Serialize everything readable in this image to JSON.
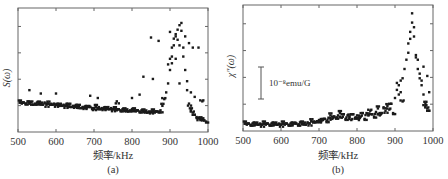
{
  "chart_data": [
    {
      "panel": "a",
      "type": "scatter",
      "title": "",
      "caption": "(a)",
      "xlabel": "频率/kHz",
      "ylabel": "S(ω)",
      "xlim": [
        500,
        1000
      ],
      "xticks": [
        500,
        600,
        700,
        800,
        900,
        1000
      ],
      "ylim": [
        0,
        1
      ],
      "yticks_count": 4,
      "yticks_labeled": false,
      "grid": false,
      "legend": null,
      "annotations": [],
      "series": [
        {
          "name": "S(ω)",
          "x": [
            505,
            510,
            515,
            520,
            525,
            530,
            535,
            540,
            545,
            550,
            555,
            560,
            565,
            570,
            575,
            580,
            585,
            590,
            595,
            600,
            605,
            610,
            615,
            620,
            625,
            630,
            635,
            640,
            645,
            650,
            655,
            660,
            665,
            670,
            675,
            680,
            685,
            690,
            695,
            700,
            705,
            710,
            715,
            720,
            725,
            730,
            735,
            740,
            745,
            750,
            755,
            760,
            765,
            770,
            775,
            780,
            785,
            790,
            795,
            800,
            805,
            810,
            815,
            820,
            825,
            830,
            835,
            840,
            845,
            850,
            855,
            860,
            865,
            870,
            875,
            880,
            885,
            890,
            895,
            900,
            905,
            910,
            915,
            920,
            925,
            930,
            935,
            940,
            945,
            950,
            955,
            960,
            965,
            970,
            975,
            980,
            985,
            990,
            995,
            530,
            560,
            600,
            690,
            710,
            760,
            800,
            820,
            830,
            850,
            855,
            870,
            895,
            900,
            905,
            910,
            915,
            920,
            925,
            930,
            935,
            940,
            950,
            960,
            975,
            900,
            905,
            915,
            925,
            945,
            955,
            965,
            985
          ],
          "y": [
            0.21,
            0.2,
            0.21,
            0.2,
            0.22,
            0.2,
            0.21,
            0.19,
            0.2,
            0.21,
            0.2,
            0.2,
            0.19,
            0.21,
            0.19,
            0.2,
            0.19,
            0.19,
            0.2,
            0.19,
            0.18,
            0.19,
            0.18,
            0.19,
            0.18,
            0.18,
            0.19,
            0.17,
            0.18,
            0.18,
            0.17,
            0.18,
            0.16,
            0.17,
            0.17,
            0.16,
            0.17,
            0.17,
            0.16,
            0.16,
            0.17,
            0.16,
            0.15,
            0.16,
            0.16,
            0.15,
            0.16,
            0.15,
            0.16,
            0.15,
            0.15,
            0.14,
            0.15,
            0.14,
            0.15,
            0.14,
            0.14,
            0.13,
            0.14,
            0.15,
            0.14,
            0.13,
            0.14,
            0.13,
            0.14,
            0.13,
            0.13,
            0.12,
            0.13,
            0.13,
            0.13,
            0.12,
            0.13,
            0.13,
            0.14,
            0.18,
            0.24,
            0.3,
            0.38,
            0.5,
            0.62,
            0.72,
            0.8,
            0.86,
            0.9,
            0.85,
            0.7,
            0.5,
            0.32,
            0.2,
            0.14,
            0.12,
            0.1,
            0.08,
            0.07,
            0.06,
            0.06,
            0.05,
            0.04,
            0.32,
            0.29,
            0.29,
            0.27,
            0.25,
            0.22,
            0.25,
            0.28,
            0.44,
            0.79,
            0.42,
            0.76,
            0.55,
            0.84,
            0.7,
            0.78,
            0.82,
            0.77,
            0.72,
            0.92,
            0.62,
            0.8,
            0.74,
            0.7,
            0.7,
            0.6,
            0.56,
            0.6,
            0.38,
            0.4,
            0.3,
            0.26,
            0.22
          ]
        }
      ]
    },
    {
      "panel": "b",
      "type": "scatter",
      "title": "",
      "caption": "(b)",
      "xlabel": "频率/kHz",
      "ylabel": "χ″(ω)",
      "xlim": [
        500,
        1000
      ],
      "xticks": [
        500,
        600,
        700,
        800,
        900,
        1000
      ],
      "ylim": [
        0,
        1
      ],
      "yticks_count": 4,
      "yticks_labeled": false,
      "grid": false,
      "legend": null,
      "annotations": [
        {
          "type": "scale-bar",
          "text": "10⁻⁸emu/G",
          "length_fraction": 0.26
        }
      ],
      "series": [
        {
          "name": "χ″(ω)",
          "x": [
            505,
            510,
            515,
            520,
            525,
            530,
            535,
            540,
            545,
            550,
            555,
            560,
            565,
            570,
            575,
            580,
            585,
            590,
            595,
            600,
            605,
            610,
            615,
            620,
            625,
            630,
            635,
            640,
            645,
            650,
            655,
            660,
            665,
            670,
            675,
            680,
            685,
            690,
            695,
            700,
            705,
            710,
            715,
            720,
            725,
            730,
            735,
            740,
            745,
            750,
            755,
            760,
            765,
            770,
            775,
            780,
            785,
            790,
            795,
            800,
            805,
            810,
            815,
            820,
            825,
            830,
            835,
            840,
            845,
            850,
            855,
            860,
            865,
            870,
            875,
            880,
            885,
            890,
            895,
            900,
            905,
            910,
            915,
            920,
            925,
            930,
            935,
            940,
            945,
            950,
            955,
            960,
            965,
            970,
            975,
            980,
            985,
            990,
            905,
            910,
            915,
            920,
            935,
            940,
            945,
            950,
            955,
            960,
            965,
            970,
            975,
            980,
            985,
            990
          ],
          "y": [
            0.03,
            0.02,
            0.03,
            0.02,
            0.03,
            0.02,
            0.03,
            0.02,
            0.03,
            0.02,
            0.03,
            0.02,
            0.03,
            0.02,
            0.03,
            0.02,
            0.03,
            0.02,
            0.03,
            0.02,
            0.03,
            0.02,
            0.03,
            0.02,
            0.03,
            0.02,
            0.03,
            0.03,
            0.02,
            0.04,
            0.03,
            0.03,
            0.02,
            0.04,
            0.03,
            0.05,
            0.04,
            0.04,
            0.05,
            0.06,
            0.04,
            0.06,
            0.07,
            0.05,
            0.08,
            0.1,
            0.07,
            0.09,
            0.08,
            0.1,
            0.12,
            0.08,
            0.11,
            0.07,
            0.1,
            0.09,
            0.06,
            0.11,
            0.08,
            0.1,
            0.06,
            0.09,
            0.12,
            0.07,
            0.12,
            0.1,
            0.14,
            0.11,
            0.09,
            0.13,
            0.16,
            0.1,
            0.12,
            0.17,
            0.14,
            0.18,
            0.15,
            0.2,
            0.12,
            0.25,
            0.32,
            0.36,
            0.3,
            0.42,
            0.5,
            0.58,
            0.72,
            0.82,
            0.9,
            0.78,
            0.62,
            0.5,
            0.42,
            0.36,
            0.28,
            0.2,
            0.16,
            0.14,
            0.38,
            0.28,
            0.4,
            0.22,
            0.64,
            0.76,
            0.98,
            0.86,
            0.6,
            0.58,
            0.46,
            0.4,
            0.52,
            0.18,
            0.44,
            0.3
          ]
        }
      ]
    }
  ],
  "panels": {
    "a": {
      "caption": "(a)",
      "xlabel": "频率/kHz",
      "ylabel": "S(ω)",
      "xticks": [
        "500",
        "600",
        "700",
        "800",
        "900",
        "1000"
      ]
    },
    "b": {
      "caption": "(b)",
      "xlabel": "频率/kHz",
      "ylabel": "χ″(ω)",
      "xticks": [
        "500",
        "600",
        "700",
        "800",
        "900",
        "1000"
      ],
      "scale_bar_label": "10⁻⁸emu/G"
    }
  }
}
